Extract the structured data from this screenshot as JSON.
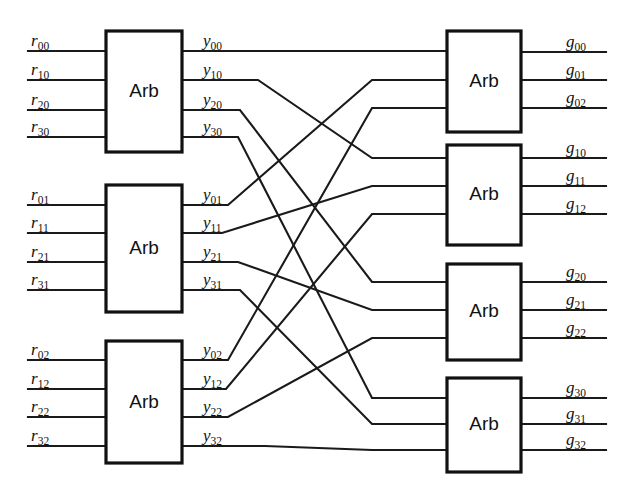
{
  "diagram": {
    "box_label": "Arb",
    "line_color": "#1a1a1a",
    "box_stroke": "#111111",
    "background": "#ffffff",
    "left_stage": {
      "name": "request-arbiter-stage",
      "count": 3,
      "boxes": [
        {
          "label": "Arb",
          "inputs": [
            "r00",
            "r10",
            "r20",
            "r30"
          ],
          "outputs": [
            "y00",
            "y10",
            "y20",
            "y30"
          ]
        },
        {
          "label": "Arb",
          "inputs": [
            "r01",
            "r11",
            "r21",
            "r31"
          ],
          "outputs": [
            "y01",
            "y11",
            "y21",
            "y31"
          ]
        },
        {
          "label": "Arb",
          "inputs": [
            "r02",
            "r12",
            "r22",
            "r32"
          ],
          "outputs": [
            "y02",
            "y12",
            "y22",
            "y32"
          ]
        }
      ]
    },
    "right_stage": {
      "name": "grant-arbiter-stage",
      "count": 4,
      "boxes": [
        {
          "label": "Arb",
          "inputs": [
            "y00",
            "y01",
            "y02"
          ],
          "outputs": [
            "g00",
            "g01",
            "g02"
          ]
        },
        {
          "label": "Arb",
          "inputs": [
            "y10",
            "y11",
            "y12"
          ],
          "outputs": [
            "g10",
            "g11",
            "g12"
          ]
        },
        {
          "label": "Arb",
          "inputs": [
            "y20",
            "y21",
            "y22"
          ],
          "outputs": [
            "g20",
            "g21",
            "g22"
          ]
        },
        {
          "label": "Arb",
          "inputs": [
            "y30",
            "y31",
            "y32"
          ],
          "outputs": [
            "g30",
            "g31",
            "g32"
          ]
        }
      ]
    },
    "interconnect": {
      "name": "transpose-shuffle",
      "description": "y_ij routes from left arbiter j output i to right arbiter i input j",
      "links": [
        {
          "from": "y00",
          "to_box": 0,
          "to_port": 0
        },
        {
          "from": "y10",
          "to_box": 1,
          "to_port": 0
        },
        {
          "from": "y20",
          "to_box": 2,
          "to_port": 0
        },
        {
          "from": "y30",
          "to_box": 3,
          "to_port": 0
        },
        {
          "from": "y01",
          "to_box": 0,
          "to_port": 1
        },
        {
          "from": "y11",
          "to_box": 1,
          "to_port": 1
        },
        {
          "from": "y21",
          "to_box": 2,
          "to_port": 1
        },
        {
          "from": "y31",
          "to_box": 3,
          "to_port": 1
        },
        {
          "from": "y02",
          "to_box": 0,
          "to_port": 2
        },
        {
          "from": "y12",
          "to_box": 1,
          "to_port": 2
        },
        {
          "from": "y22",
          "to_box": 2,
          "to_port": 2
        },
        {
          "from": "y32",
          "to_box": 3,
          "to_port": 2
        }
      ]
    }
  }
}
